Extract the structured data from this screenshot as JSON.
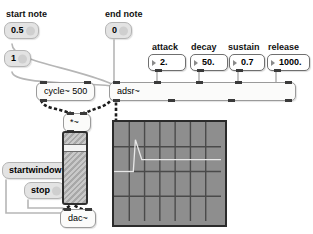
{
  "patch": {
    "title": "adsr envelope patch",
    "background": "#ffffff",
    "width": 313,
    "height": 234
  },
  "comments": {
    "start_note": "start note",
    "end_note": "end note",
    "attack": "attack",
    "decay": "decay",
    "sustain": "sustain",
    "release": "release"
  },
  "messages": {
    "start_half": "0.5",
    "start_one": "1",
    "end_zero": "0",
    "startwindow": "startwindow",
    "stop": "stop"
  },
  "numbers": {
    "attack": "2.",
    "decay": "50.",
    "sustain": "0.7",
    "release": "1000."
  },
  "objects": {
    "cycle": "cycle~ 500",
    "adsr": "adsr~",
    "multiply": "*~",
    "dac": "dac~"
  },
  "slider": {
    "name": "output-level-slider",
    "value_fraction": 0.82
  },
  "graph": {
    "name": "envelope-graph",
    "background": "#8e8e8e",
    "grid_columns": 7,
    "grid_rows": 4,
    "trace_color": "#e8e8e8"
  },
  "chart_data": {
    "type": "line",
    "title": "",
    "xlabel": "",
    "ylabel": "",
    "grid": true,
    "legend": "none",
    "xlim": [
      0,
      100
    ],
    "ylim": [
      0,
      1
    ],
    "series": [
      {
        "name": "adsr envelope",
        "x": [
          0,
          18,
          20,
          26,
          100
        ],
        "y": [
          0.5,
          0.5,
          0.82,
          0.62,
          0.62
        ]
      }
    ]
  },
  "colors": {
    "canvas": "#ffffff",
    "message_fill": "#e3e3e3",
    "object_fill": "#fbfbfa",
    "number_fill": "#ffffff",
    "wire_control": "#b0b0b0",
    "wire_signal": "#1a1a1a",
    "graph_fill": "#8e8e8e"
  }
}
